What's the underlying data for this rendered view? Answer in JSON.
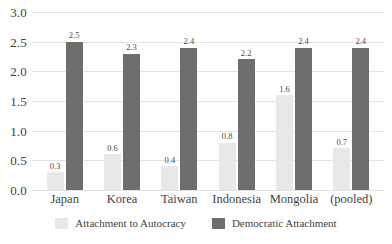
{
  "chart_data": {
    "type": "bar",
    "title": "",
    "subtitle": "",
    "xlabel": "",
    "ylabel": "",
    "ylim": [
      0,
      3.0
    ],
    "ytick_step": 0.5,
    "yticks": [
      "3.0",
      "2.5",
      "2.0",
      "1.5",
      "1.0",
      "0.5",
      "0.0"
    ],
    "grid": true,
    "legend_position": "bottom-center",
    "categories": [
      "Japan",
      "Korea",
      "Taiwan",
      "Indonesia",
      "Mongolia",
      "(pooled)"
    ],
    "series": [
      {
        "name": "Attachment to Autocracy",
        "color": "#e8e8e8",
        "values": [
          0.3,
          0.6,
          0.4,
          0.8,
          1.6,
          0.7
        ],
        "labels": [
          "0.3",
          "0.6",
          "0.4",
          "0.8",
          "1.6",
          "0.7"
        ]
      },
      {
        "name": "Democratic Attachment",
        "color": "#6e6e6e",
        "values": [
          2.5,
          2.3,
          2.4,
          2.2,
          2.4,
          2.4
        ],
        "labels": [
          "2.5",
          "2.3",
          "2.4",
          "2.2",
          "2.4",
          "2.4"
        ]
      }
    ]
  },
  "colors": {
    "autocracy": "#e8e8e8",
    "democratic": "#6e6e6e",
    "gridline": "#e3e3e3",
    "text": "#3f3f3f",
    "background": "#ffffff"
  }
}
